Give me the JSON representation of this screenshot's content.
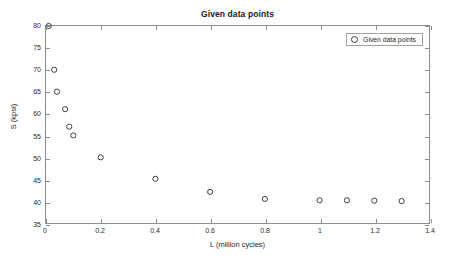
{
  "chart_data": {
    "type": "scatter",
    "title": "Given data points",
    "xlabel": "L (million cycles)",
    "ylabel": "S (kpsi)",
    "xlim": [
      0,
      1.4
    ],
    "ylim": [
      35,
      80
    ],
    "xticks": [
      0,
      0.2,
      0.4,
      0.6,
      0.8,
      1,
      1.2,
      1.4
    ],
    "xtick_labels": [
      "0",
      "0.2",
      "0.4",
      "0.6",
      "0.8",
      "1",
      "1.2",
      "1.4"
    ],
    "yticks": [
      35,
      40,
      45,
      50,
      55,
      60,
      65,
      70,
      75,
      80
    ],
    "ytick_labels": [
      "35",
      "40",
      "45",
      "50",
      "55",
      "60",
      "65",
      "70",
      "75",
      "80"
    ],
    "grid": false,
    "legend_position": "upper right",
    "series": [
      {
        "name": "Given data points",
        "marker": "circle-open",
        "color": "#3c3c3c",
        "x": [
          0.01,
          0.03,
          0.04,
          0.07,
          0.085,
          0.1,
          0.2,
          0.4,
          0.6,
          0.8,
          1.0,
          1.1,
          1.2,
          1.3
        ],
        "y": [
          80,
          70,
          65,
          61,
          57,
          55,
          50,
          45.1,
          42.1,
          40.5,
          40.2,
          40.2,
          40.1,
          40.0
        ]
      }
    ]
  },
  "legend": {
    "entries": [
      {
        "label": "Given data points",
        "marker_icon": "circle-open-marker"
      }
    ]
  },
  "colors": {
    "axis": "#8d8d8d",
    "text": "#1f1f1f",
    "marker": "#3c3c3c",
    "background": "#ffffff"
  }
}
